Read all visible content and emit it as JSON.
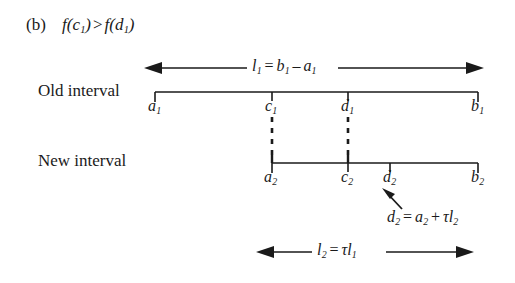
{
  "figure": {
    "caption_tag": "(b)",
    "caption_expr_left_fn": "f",
    "caption_expr_left_arg": "c",
    "caption_expr_left_sub": "1",
    "caption_relation": ">",
    "caption_expr_right_fn": "f",
    "caption_expr_right_arg": "d",
    "caption_expr_right_sub": "1",
    "background_color": "#ffffff",
    "ink_color": "#1a1a1a"
  },
  "rows": {
    "old_interval_label": "Old interval",
    "new_interval_label": "New interval"
  },
  "old_interval": {
    "ticks": [
      {
        "name": "a",
        "sub": "1"
      },
      {
        "name": "c",
        "sub": "1"
      },
      {
        "name": "d",
        "sub": "1"
      },
      {
        "name": "b",
        "sub": "1"
      }
    ]
  },
  "new_interval": {
    "ticks": [
      {
        "name": "a",
        "sub": "2"
      },
      {
        "name": "c",
        "sub": "2"
      },
      {
        "name": "d",
        "sub": "2"
      },
      {
        "name": "b",
        "sub": "2"
      }
    ]
  },
  "measures": {
    "top": {
      "lhs_sym": "l",
      "lhs_sub": "1",
      "eq": "=",
      "rhs_first_sym": "b",
      "rhs_first_sub": "1",
      "rhs_op": "–",
      "rhs_second_sym": "a",
      "rhs_second_sub": "1"
    },
    "bottom": {
      "lhs_sym": "l",
      "lhs_sub": "2",
      "eq": "=",
      "rhs_tau": "τ",
      "rhs_sym": "l",
      "rhs_sub": "1"
    }
  },
  "annotation": {
    "lhs_sym": "d",
    "lhs_sub": "2",
    "eq": "=",
    "rhs_first_sym": "a",
    "rhs_first_sub": "2",
    "rhs_op": "+",
    "rhs_tau": "τ",
    "rhs_second_sym": "l",
    "rhs_second_sub": "2"
  }
}
